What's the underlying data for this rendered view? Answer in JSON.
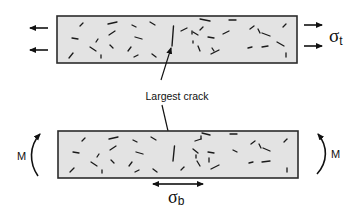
{
  "diagram": {
    "colors": {
      "beam_fill": "#e3e3e3",
      "beam_stroke": "#2b2b2b",
      "crack": "#1a1a1a",
      "arrow": "#111111",
      "background": "#ffffff"
    },
    "labels": {
      "largest_crack": "Largest crack",
      "sigma_t": "σ",
      "sigma_t_sub": "t",
      "sigma_b": "σ",
      "sigma_b_sub": "b",
      "moment_left": "M",
      "moment_right": "M"
    },
    "panels": [
      {
        "name": "tension-specimen",
        "loading": "uniaxial tension",
        "stress_symbol": "σt",
        "beam": {
          "x": 57,
          "y": 16,
          "w": 240,
          "h": 47
        },
        "largest_crack": {
          "x1": 173,
          "y1": 26,
          "x2": 172,
          "y2": 46
        }
      },
      {
        "name": "bending-specimen",
        "loading": "bending moment M",
        "stress_symbol": "σb",
        "beam": {
          "x": 58,
          "y": 131,
          "w": 240,
          "h": 47
        },
        "largest_crack": {
          "x1": 174,
          "y1": 146,
          "x2": 173,
          "y2": 161
        }
      }
    ]
  }
}
